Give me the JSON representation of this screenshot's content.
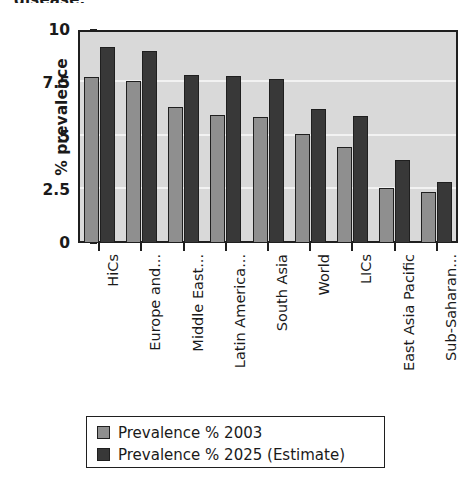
{
  "caption_fragment": "disease.",
  "chart_data": {
    "type": "bar",
    "title": "",
    "xlabel": "",
    "ylabel": "% prevalence",
    "ylim": [
      0,
      10
    ],
    "yticks": [
      "0",
      "2.5",
      "5",
      "7.5",
      "10"
    ],
    "ytick_values": [
      0,
      2.5,
      5,
      7.5,
      10
    ],
    "grid": true,
    "legend_position": "bottom",
    "categories": [
      "HiCs",
      "Europe and...",
      "Middle East...",
      "Latin America...",
      "South Asia",
      "World",
      "LICs",
      "East Asia Pacific",
      "Sub-Saharan..."
    ],
    "series": [
      {
        "name": "Prevalence % 2003",
        "color": "#8f8f8f",
        "values": [
          7.8,
          7.6,
          6.4,
          6.0,
          5.9,
          5.1,
          4.5,
          2.6,
          2.4
        ]
      },
      {
        "name": "Prevalence % 2025 (Estimate)",
        "color": "#383838",
        "values": [
          9.2,
          9.0,
          7.9,
          7.85,
          7.7,
          6.3,
          5.95,
          3.9,
          2.85
        ]
      }
    ]
  }
}
